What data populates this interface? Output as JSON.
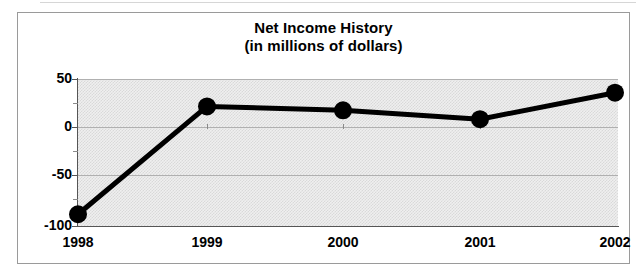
{
  "chart_data": {
    "type": "line",
    "title": "Net Income History",
    "subtitle": "(in millions of dollars)",
    "xlabel": "",
    "ylabel": "",
    "categories": [
      "1998",
      "1999",
      "2000",
      "2001",
      "2002"
    ],
    "x": [
      1998,
      1999,
      2000,
      2001,
      2002
    ],
    "values": [
      -88,
      22,
      18,
      9,
      36
    ],
    "series": [
      {
        "name": "Net Income",
        "values": [
          -88,
          22,
          18,
          9,
          36
        ]
      }
    ],
    "ylim": [
      -100,
      50
    ],
    "yticks": [
      50,
      0,
      -50,
      -100
    ],
    "ytick_labels": [
      "50",
      "0",
      "-50",
      "-100"
    ],
    "yminor_ticks": [
      25,
      -25,
      -75
    ],
    "xticks": [
      "1998",
      "1999",
      "2000",
      "2001",
      "2002"
    ],
    "grid": true,
    "grid_axis": "y",
    "legend": false,
    "legend_position": "none",
    "marker": "circle-filled",
    "line_color": "#000000",
    "marker_color": "#000000",
    "plot_background": "#e8e8e8",
    "frame_color": "#9a9a9a",
    "gridline_color": "#b0b0b0"
  },
  "labels": {
    "y": {
      "t50": "50",
      "t0": "0",
      "tm50": "-50",
      "tm100": "-100"
    },
    "x": {
      "y1998": "1998",
      "y1999": "1999",
      "y2000": "2000",
      "y2001": "2001",
      "y2002": "2002"
    }
  }
}
